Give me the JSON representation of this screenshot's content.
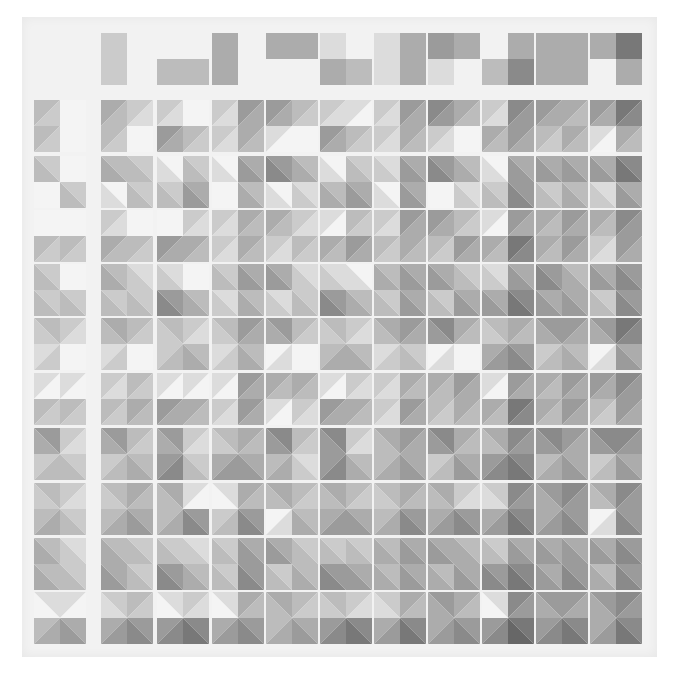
{
  "image": {
    "subject": "grayscale geometric quilt",
    "description": "Quilt of 11 columns: a header row of partial rectangle blocks above 10 rows of square blocks made of half-square triangles, shading darker toward the right and bottom."
  },
  "palette": {
    "background": "#ffffff",
    "quilt_border": "#f2f2f2",
    "seam": "#f7f7f7",
    "shades": [
      "#f4f4f4",
      "#dcdcdc",
      "#cbcbcb",
      "#bcbcbc",
      "#acacac",
      "#9b9b9b",
      "#8a8a8a",
      "#787878",
      "#676767"
    ]
  },
  "grid": {
    "columns": 11,
    "rows": 10,
    "col_x": [
      34,
      101,
      157,
      212,
      266,
      320,
      374,
      428,
      482,
      536,
      590
    ],
    "block_w": 52,
    "row_y": [
      100,
      156,
      210,
      264,
      318,
      373,
      428,
      483,
      538,
      592
    ],
    "block_h": 52
  },
  "header_row": {
    "y": 33,
    "h": 52,
    "blocks": [
      {
        "col": 0,
        "cells": [
          0,
          0,
          0,
          0
        ]
      },
      {
        "col": 1,
        "cells": [
          2,
          0,
          2,
          0
        ]
      },
      {
        "col": 2,
        "cells": [
          0,
          0,
          3,
          3
        ]
      },
      {
        "col": 3,
        "cells": [
          4,
          0,
          4,
          0
        ]
      },
      {
        "col": 4,
        "cells": [
          4,
          4,
          0,
          0
        ]
      },
      {
        "col": 5,
        "cells": [
          1,
          0,
          4,
          3
        ]
      },
      {
        "col": 6,
        "cells": [
          1,
          4,
          1,
          4
        ]
      },
      {
        "col": 7,
        "cells": [
          5,
          4,
          1,
          0
        ]
      },
      {
        "col": 8,
        "cells": [
          0,
          4,
          3,
          6
        ]
      },
      {
        "col": 9,
        "cells": [
          4,
          4,
          4,
          4
        ]
      },
      {
        "col": 10,
        "cells": [
          4,
          7,
          0,
          4
        ]
      }
    ]
  },
  "rows": [
    {
      "pattern": "slash",
      "blocks": [
        [
          3,
          0,
          3,
          0
        ],
        [
          4,
          2,
          3,
          0
        ],
        [
          2,
          0,
          5,
          3
        ],
        [
          2,
          5,
          2,
          4
        ],
        [
          5,
          3,
          1,
          0
        ],
        [
          2,
          1,
          5,
          3
        ],
        [
          2,
          5,
          2,
          4
        ],
        [
          6,
          4,
          2,
          0
        ],
        [
          2,
          6,
          4,
          5
        ],
        [
          5,
          4,
          3,
          4
        ],
        [
          5,
          7,
          1,
          4
        ]
      ]
    },
    {
      "pattern": "backslash",
      "blocks": [
        [
          3,
          0,
          0,
          3
        ],
        [
          4,
          3,
          1,
          3
        ],
        [
          1,
          3,
          3,
          5
        ],
        [
          1,
          5,
          0,
          4
        ],
        [
          6,
          4,
          1,
          2
        ],
        [
          1,
          3,
          4,
          5
        ],
        [
          2,
          5,
          1,
          5
        ],
        [
          6,
          4,
          0,
          2
        ],
        [
          1,
          5,
          3,
          6
        ],
        [
          5,
          5,
          3,
          4
        ],
        [
          5,
          7,
          2,
          5
        ]
      ]
    },
    {
      "pattern": "slash",
      "blocks": [
        [
          0,
          0,
          3,
          3
        ],
        [
          2,
          0,
          4,
          3
        ],
        [
          0,
          2,
          5,
          4
        ],
        [
          2,
          4,
          2,
          4
        ],
        [
          4,
          2,
          2,
          3
        ],
        [
          1,
          3,
          4,
          5
        ],
        [
          2,
          5,
          3,
          4
        ],
        [
          5,
          3,
          3,
          5
        ],
        [
          1,
          5,
          4,
          7
        ],
        [
          4,
          5,
          4,
          5
        ],
        [
          4,
          6,
          2,
          5
        ]
      ]
    },
    {
      "pattern": "backslash",
      "blocks": [
        [
          3,
          0,
          3,
          3
        ],
        [
          4,
          2,
          3,
          3
        ],
        [
          2,
          0,
          6,
          4
        ],
        [
          3,
          5,
          2,
          4
        ],
        [
          5,
          2,
          2,
          3
        ],
        [
          2,
          1,
          6,
          4
        ],
        [
          4,
          5,
          3,
          5
        ],
        [
          5,
          3,
          3,
          5
        ],
        [
          2,
          5,
          5,
          7
        ],
        [
          6,
          4,
          5,
          5
        ],
        [
          5,
          6,
          3,
          6
        ]
      ]
    },
    {
      "pattern": "hourglass",
      "blocks": [
        [
          3,
          2,
          2,
          0
        ],
        [
          4,
          3,
          2,
          0
        ],
        [
          3,
          2,
          3,
          4
        ],
        [
          3,
          5,
          2,
          4
        ],
        [
          5,
          3,
          1,
          0
        ],
        [
          3,
          2,
          4,
          4
        ],
        [
          4,
          5,
          2,
          3
        ],
        [
          6,
          4,
          1,
          0
        ],
        [
          3,
          4,
          5,
          6
        ],
        [
          5,
          5,
          3,
          4
        ],
        [
          5,
          7,
          1,
          5
        ]
      ]
    },
    {
      "pattern": "slash",
      "blocks": [
        [
          1,
          1,
          3,
          3
        ],
        [
          2,
          3,
          3,
          4
        ],
        [
          1,
          1,
          5,
          4
        ],
        [
          1,
          5,
          2,
          5
        ],
        [
          4,
          4,
          1,
          2
        ],
        [
          1,
          2,
          5,
          4
        ],
        [
          2,
          4,
          2,
          5
        ],
        [
          4,
          5,
          3,
          4
        ],
        [
          1,
          5,
          4,
          7
        ],
        [
          4,
          5,
          4,
          5
        ],
        [
          5,
          6,
          3,
          5
        ]
      ]
    },
    {
      "pattern": "hourglass",
      "blocks": [
        [
          5,
          2,
          3,
          3
        ],
        [
          5,
          3,
          3,
          4
        ],
        [
          5,
          2,
          6,
          3
        ],
        [
          3,
          4,
          5,
          5
        ],
        [
          6,
          3,
          4,
          2
        ],
        [
          6,
          2,
          6,
          4
        ],
        [
          4,
          5,
          4,
          5
        ],
        [
          6,
          4,
          3,
          5
        ],
        [
          4,
          6,
          6,
          7
        ],
        [
          6,
          5,
          4,
          5
        ],
        [
          6,
          6,
          3,
          5
        ]
      ]
    },
    {
      "pattern": "hourglass",
      "blocks": [
        [
          3,
          2,
          4,
          3
        ],
        [
          3,
          4,
          4,
          5
        ],
        [
          4,
          1,
          4,
          6
        ],
        [
          1,
          4,
          3,
          6
        ],
        [
          4,
          3,
          1,
          4
        ],
        [
          4,
          3,
          5,
          5
        ],
        [
          3,
          4,
          4,
          6
        ],
        [
          4,
          2,
          5,
          6
        ],
        [
          2,
          6,
          5,
          7
        ],
        [
          5,
          6,
          5,
          6
        ],
        [
          4,
          6,
          1,
          6
        ]
      ]
    },
    {
      "pattern": "backslash",
      "blocks": [
        [
          4,
          2,
          4,
          3
        ],
        [
          4,
          3,
          5,
          3
        ],
        [
          3,
          2,
          6,
          4
        ],
        [
          3,
          5,
          3,
          6
        ],
        [
          5,
          3,
          3,
          4
        ],
        [
          3,
          3,
          6,
          5
        ],
        [
          4,
          5,
          4,
          5
        ],
        [
          5,
          4,
          4,
          5
        ],
        [
          3,
          5,
          6,
          7
        ],
        [
          5,
          5,
          5,
          6
        ],
        [
          5,
          6,
          4,
          6
        ]
      ]
    },
    {
      "pattern": "hourglass",
      "blocks": [
        [
          1,
          1,
          4,
          5
        ],
        [
          2,
          3,
          5,
          6
        ],
        [
          1,
          2,
          6,
          7
        ],
        [
          1,
          4,
          5,
          6
        ],
        [
          4,
          3,
          4,
          5
        ],
        [
          3,
          2,
          6,
          7
        ],
        [
          2,
          4,
          5,
          7
        ],
        [
          5,
          4,
          5,
          6
        ],
        [
          1,
          6,
          6,
          8
        ],
        [
          5,
          5,
          6,
          7
        ],
        [
          5,
          6,
          5,
          7
        ]
      ]
    }
  ]
}
